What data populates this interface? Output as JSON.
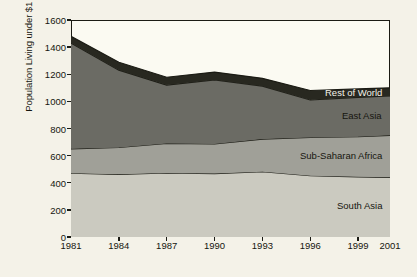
{
  "chart_data": {
    "type": "area",
    "title": "",
    "subtitle": "",
    "xlabel": "",
    "ylabel": "Population Living under $1 per Day (millions)",
    "x": [
      1981,
      1984,
      1987,
      1990,
      1993,
      1996,
      1999,
      2001
    ],
    "categories": [
      "1981",
      "1984",
      "1987",
      "1990",
      "1993",
      "1996",
      "1999",
      "2001"
    ],
    "xlim": [
      1981,
      2001
    ],
    "ylim": [
      0,
      1600
    ],
    "yticks": [
      0,
      200,
      400,
      600,
      800,
      1000,
      1200,
      1400,
      1600
    ],
    "ytick_labels": [
      "0",
      "200",
      "400",
      "600",
      "800",
      "1000",
      "1200",
      "1400",
      "1600"
    ],
    "xtick_labels": [
      "1981",
      "1984",
      "1987",
      "1990",
      "1993",
      "1996",
      "1999",
      "2001"
    ],
    "grid": false,
    "legend_position": "inline-annotations",
    "stacked": true,
    "stack_order_bottom_to_top": [
      "South Asia",
      "Sub-Saharan Africa",
      "East Asia",
      "Rest of World"
    ],
    "series": [
      {
        "name": "South Asia",
        "color": "#cbcac0",
        "values": [
          470,
          462,
          472,
          468,
          482,
          452,
          444,
          440
        ]
      },
      {
        "name": "Sub-Saharan Africa",
        "color": "#a0a098",
        "values": [
          180,
          198,
          218,
          218,
          240,
          282,
          296,
          310
        ]
      },
      {
        "name": "East Asia",
        "color": "#6b6b64",
        "values": [
          780,
          570,
          430,
          472,
          390,
          276,
          290,
          290
        ]
      },
      {
        "name": "Rest of World",
        "color": "#282820",
        "values": [
          50,
          58,
          58,
          58,
          58,
          70,
          62,
          60
        ]
      }
    ],
    "cumulative_totals": [
      1480,
      1288,
      1178,
      1216,
      1170,
      1080,
      1092,
      1100
    ],
    "annotations": [
      {
        "text": "Rest of World",
        "series": "Rest of World"
      },
      {
        "text": "East Asia",
        "series": "East Asia"
      },
      {
        "text": "Sub-Saharan Africa",
        "series": "Sub-Saharan Africa"
      },
      {
        "text": "South Asia",
        "series": "South Asia"
      }
    ],
    "colors": {
      "background": "#f4f2e8",
      "plot_background": "#fbfaf2",
      "axis": "#1b1b14",
      "text": "#16160f"
    }
  }
}
